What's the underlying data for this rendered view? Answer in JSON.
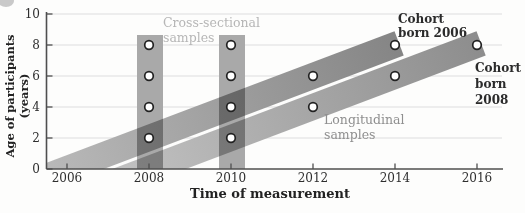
{
  "figure": {
    "y_axis_title": "Age of participants (years)",
    "x_axis_title": "Time of measurement",
    "annotations": {
      "cross_sectional": {
        "line1": "Cross-sectional",
        "line2": "samples"
      },
      "longitudinal": {
        "line1": "Longitudinal",
        "line2": "samples"
      },
      "cohort_2006": {
        "line1": "Cohort",
        "line2": "born 2006"
      },
      "cohort_2008": {
        "line1": "Cohort",
        "line2": "born",
        "line3": "2008"
      }
    }
  },
  "chart_data": {
    "type": "scatter",
    "design": "cohort-sequential developmental study design",
    "xlabel": "Time of measurement",
    "ylabel": "Age of participants (years)",
    "x_ticks": [
      "2006",
      "2008",
      "2010",
      "2012",
      "2014",
      "2016"
    ],
    "y_ticks": [
      "0",
      "2",
      "4",
      "6",
      "8",
      "10"
    ],
    "xlim": [
      2005.4,
      2016.6
    ],
    "ylim": [
      0,
      10.1
    ],
    "grid": "horizontal gridlines at ages 2, 4, 6, 8, 10",
    "cross_sectional_samples": {
      "label": "Cross-sectional samples",
      "measurement_years": [
        2008,
        2010
      ],
      "ages_sampled": [
        2,
        4,
        6,
        8
      ],
      "band_color": "#a9a9a9"
    },
    "longitudinal_cohorts": [
      {
        "label": "Cohort born 2006",
        "birth_year": 2006,
        "points": [
          {
            "year": 2008,
            "age": 2
          },
          {
            "year": 2010,
            "age": 4
          },
          {
            "year": 2012,
            "age": 6
          },
          {
            "year": 2014,
            "age": 8
          }
        ],
        "band_color_start": "#bdbdbd",
        "band_color_end": "#858585"
      },
      {
        "label": "Cohort born 2008",
        "birth_year": 2008,
        "points": [
          {
            "year": 2010,
            "age": 2
          },
          {
            "year": 2012,
            "age": 4
          },
          {
            "year": 2014,
            "age": 6
          },
          {
            "year": 2016,
            "age": 8
          }
        ],
        "band_color_start": "#c4c4c4",
        "band_color_end": "#8d8d8d"
      }
    ],
    "marker": {
      "shape": "circle",
      "fill": "#ffffff",
      "stroke": "#222222"
    },
    "colors": {
      "axis": "#4f4f4f",
      "grid": "#dedede",
      "tick_label": "#2e2e2e",
      "cross_sectional_label": "#b6b6b6",
      "longitudinal_label": "#8f8f8f",
      "cohort_label": "#2b2b2b"
    }
  }
}
